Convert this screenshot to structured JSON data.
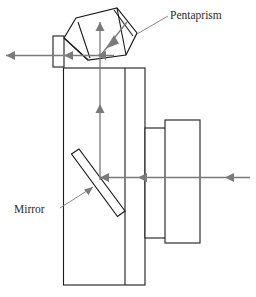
{
  "figure": {
    "background_color": "#ffffff",
    "outline_color": "#1c1c1c",
    "ray_color": "#7a7a7a",
    "leader_color": "#8a8a8a",
    "label_color": "#2b2b2b",
    "width": 256,
    "height": 297
  },
  "labels": {
    "pentaprism": "Pentaprism",
    "mirror": "Mirror"
  },
  "components": [
    {
      "name": "pentaprism",
      "label": "Pentaprism",
      "shape": "pentagon",
      "tilted": true
    },
    {
      "name": "mirror",
      "label": "Mirror",
      "shape": "tilted-bar",
      "angle_deg": 45
    },
    {
      "name": "camera-body",
      "label": "",
      "shape": "rectangle"
    },
    {
      "name": "eyepiece",
      "label": "",
      "shape": "rectangle"
    },
    {
      "name": "lens-barrel-inner",
      "label": "",
      "shape": "rectangle"
    },
    {
      "name": "lens-barrel-outer",
      "label": "",
      "shape": "rectangle"
    }
  ],
  "rays": [
    {
      "name": "incoming-ray",
      "direction": "leftward",
      "orientation": "horizontal",
      "arrowheads": 3
    },
    {
      "name": "mirror-reflected-ray",
      "direction": "upward",
      "orientation": "vertical",
      "arrowheads": 3
    },
    {
      "name": "prism-internal-ray",
      "direction": "down-right-diagonal",
      "orientation": "diagonal",
      "arrowheads": 1
    },
    {
      "name": "eyepiece-exit-ray",
      "direction": "leftward",
      "orientation": "horizontal",
      "arrowheads": 3
    }
  ]
}
